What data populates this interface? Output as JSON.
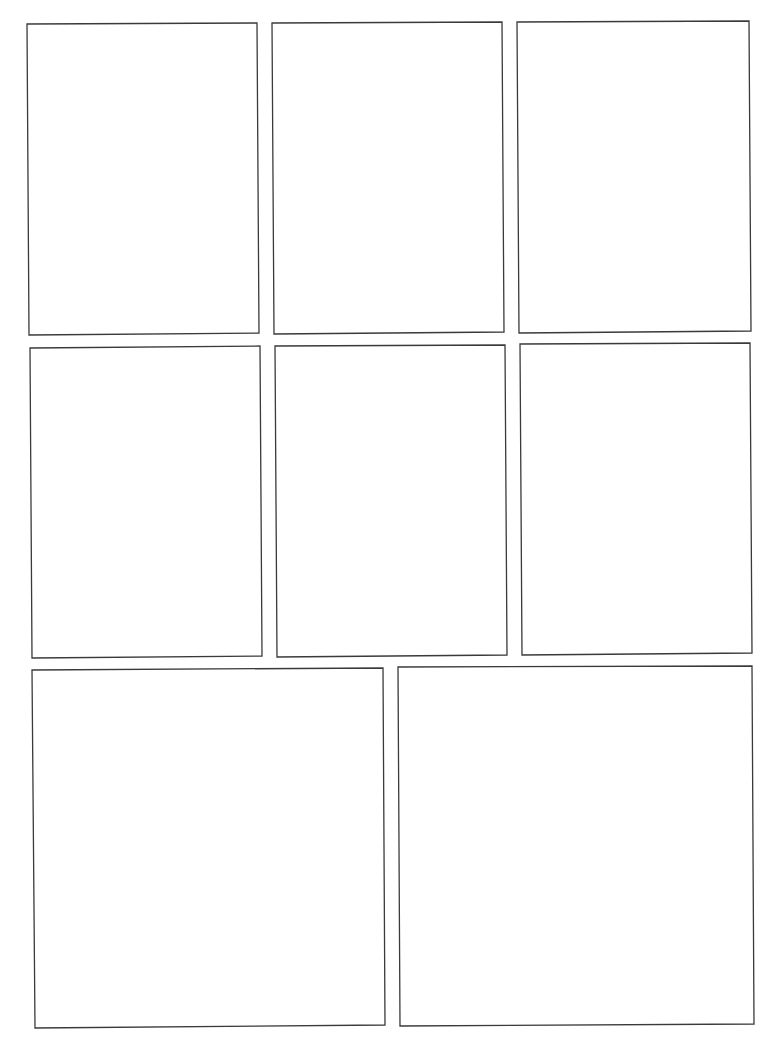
{
  "page": {
    "width": 768,
    "height": 1053,
    "background": "#ffffff",
    "border_color": "#3a3a3a"
  },
  "panels": [
    {
      "id": 1,
      "row": 1,
      "col": 1,
      "corners": [
        [
          27,
          24
        ],
        [
          257,
          23
        ],
        [
          259,
          333
        ],
        [
          29,
          335
        ]
      ]
    },
    {
      "id": 2,
      "row": 1,
      "col": 2,
      "corners": [
        [
          272,
          23
        ],
        [
          502,
          22
        ],
        [
          504,
          332
        ],
        [
          274,
          334
        ]
      ]
    },
    {
      "id": 3,
      "row": 1,
      "col": 3,
      "corners": [
        [
          517,
          22
        ],
        [
          749,
          21
        ],
        [
          751,
          331
        ],
        [
          519,
          333
        ]
      ]
    },
    {
      "id": 4,
      "row": 2,
      "col": 1,
      "corners": [
        [
          30,
          348
        ],
        [
          260,
          346
        ],
        [
          262,
          656
        ],
        [
          32,
          658
        ]
      ]
    },
    {
      "id": 5,
      "row": 2,
      "col": 2,
      "corners": [
        [
          275,
          346
        ],
        [
          505,
          345
        ],
        [
          507,
          655
        ],
        [
          277,
          657
        ]
      ]
    },
    {
      "id": 6,
      "row": 2,
      "col": 3,
      "corners": [
        [
          520,
          344
        ],
        [
          750,
          343
        ],
        [
          752,
          653
        ],
        [
          522,
          655
        ]
      ]
    },
    {
      "id": 7,
      "row": 3,
      "col": 1,
      "corners": [
        [
          32,
          670
        ],
        [
          383,
          668
        ],
        [
          385,
          1025
        ],
        [
          35,
          1028
        ]
      ]
    },
    {
      "id": 8,
      "row": 3,
      "col": 2,
      "corners": [
        [
          398,
          667
        ],
        [
          752,
          666
        ],
        [
          754,
          1024
        ],
        [
          400,
          1026
        ]
      ]
    }
  ]
}
